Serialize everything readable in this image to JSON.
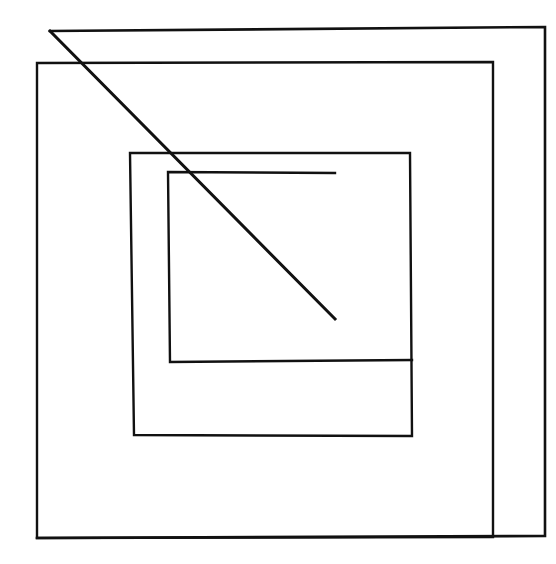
{
  "figure": {
    "background_color": "#ffffff",
    "stroke_color": "#111111",
    "canvas": {
      "width": 556,
      "height": 564
    },
    "shapes": [
      {
        "name": "outer-square-path",
        "kind": "open-polyline",
        "stroke_width": 2.6,
        "points": "50,31 545,27 545,536 37,538",
        "description": "Outermost square, open along left edge; its top-left vertex is the origin of the diagonal"
      },
      {
        "name": "second-square-path",
        "kind": "closed-polygon",
        "stroke_width": 2.4,
        "points": "37,63 493,62 493,537 37,538",
        "description": "Second nested square"
      },
      {
        "name": "third-square-path",
        "kind": "closed-polygon",
        "stroke_width": 2.4,
        "points": "130,153 410,153 412,436 134,435",
        "description": "Third nested square"
      },
      {
        "name": "inner-square-path",
        "kind": "open-polyline",
        "stroke_width": 2.4,
        "points": "335,173 168,172 170,362 412,360",
        "description": "Innermost rectangle, open on the right where the diagonal terminates"
      },
      {
        "name": "diagonal-line",
        "kind": "line",
        "stroke_width": 3.0,
        "points": "50,31 335,319",
        "description": "Diagonal stroke from the outer square's top-left vertex to the inner rectangle's lower right vertex"
      }
    ]
  }
}
